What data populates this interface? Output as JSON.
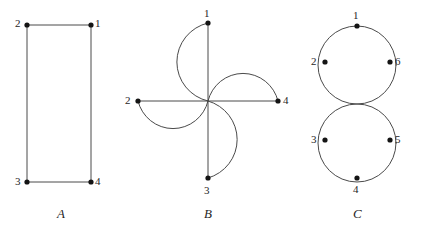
{
  "canvas": {
    "width": 425,
    "height": 231,
    "background_color": "#ffffff",
    "stroke_color": "#4a4a4a",
    "vertex_color": "#141414",
    "label_color": "#262626"
  },
  "figures": [
    {
      "id": "figure-a",
      "caption": "A",
      "caption_pos": {
        "x": 57,
        "y": 207
      },
      "description": "rectangle-four-cycle",
      "vertices": [
        {
          "label": "1",
          "x": 91,
          "y": 25,
          "label_x": 95,
          "label_y": 18
        },
        {
          "label": "2",
          "x": 27,
          "y": 25,
          "label_x": 15,
          "label_y": 18
        },
        {
          "label": "3",
          "x": 27,
          "y": 182,
          "label_x": 15,
          "label_y": 176
        },
        {
          "label": "4",
          "x": 91,
          "y": 182,
          "label_x": 95,
          "label_y": 176
        }
      ],
      "edges": [
        {
          "from": "2",
          "to": "1",
          "d": "M 27 25 L 91 25"
        },
        {
          "from": "1",
          "to": "4",
          "d": "M 91 25 L 91 182"
        },
        {
          "from": "4",
          "to": "3",
          "d": "M 91 182 L 27 182"
        },
        {
          "from": "3",
          "to": "2",
          "d": "M 27 182 L 27 25"
        }
      ]
    },
    {
      "id": "figure-b",
      "caption": "B",
      "caption_pos": {
        "x": 204,
        "y": 207
      },
      "description": "pinwheel-four-loops",
      "center": {
        "x": 208,
        "y": 101
      },
      "vertices": [
        {
          "label": "1",
          "x": 208,
          "y": 23,
          "label_x": 204,
          "label_y": 8
        },
        {
          "label": "2",
          "x": 138,
          "y": 101,
          "label_x": 125,
          "label_y": 95
        },
        {
          "label": "3",
          "x": 208,
          "y": 178,
          "label_x": 204,
          "label_y": 185
        },
        {
          "label": "4",
          "x": 278,
          "y": 101,
          "label_x": 283,
          "label_y": 95
        }
      ],
      "edges": [
        {
          "from": "1",
          "to": "center",
          "d": "M 208 23 L 208 101"
        },
        {
          "from": "2",
          "to": "center",
          "d": "M 138 101 L 208 101"
        },
        {
          "from": "3",
          "to": "center",
          "d": "M 208 178 L 208 101"
        },
        {
          "from": "4",
          "to": "center",
          "d": "M 278 101 L 208 101"
        },
        {
          "from": "1",
          "to": "center",
          "d": "M 208 23 A 40 40 0 0 0 208 101",
          "kind": "arc-upper-left"
        },
        {
          "from": "2",
          "to": "center",
          "d": "M 138 101 A 36 36 0 0 0 208 101",
          "kind": "arc-lower-left"
        },
        {
          "from": "3",
          "to": "center",
          "d": "M 208 178 A 40 40 0 0 0 208 101",
          "kind": "arc-lower-right"
        },
        {
          "from": "4",
          "to": "center",
          "d": "M 278 101 A 36 36 0 0 0 208 101",
          "kind": "arc-upper-right"
        }
      ]
    },
    {
      "id": "figure-c",
      "caption": "C",
      "caption_pos": {
        "x": 353,
        "y": 207
      },
      "description": "two-tangent-circles",
      "circles": [
        {
          "cx": 357,
          "cy": 65,
          "r": 39
        },
        {
          "cx": 357,
          "cy": 143,
          "r": 39
        }
      ],
      "tangent_point": {
        "x": 357,
        "y": 104
      },
      "vertices": [
        {
          "label": "1",
          "x": 357,
          "y": 26,
          "label_x": 353,
          "label_y": 10
        },
        {
          "label": "2",
          "x": 325,
          "y": 62,
          "label_x": 311,
          "label_y": 56
        },
        {
          "label": "6",
          "x": 390,
          "y": 62,
          "label_x": 395,
          "label_y": 56
        },
        {
          "label": "3",
          "x": 325,
          "y": 140,
          "label_x": 311,
          "label_y": 134
        },
        {
          "label": "5",
          "x": 390,
          "y": 140,
          "label_x": 395,
          "label_y": 134
        },
        {
          "label": "4",
          "x": 357,
          "y": 178,
          "label_x": 353,
          "label_y": 184
        }
      ]
    }
  ]
}
